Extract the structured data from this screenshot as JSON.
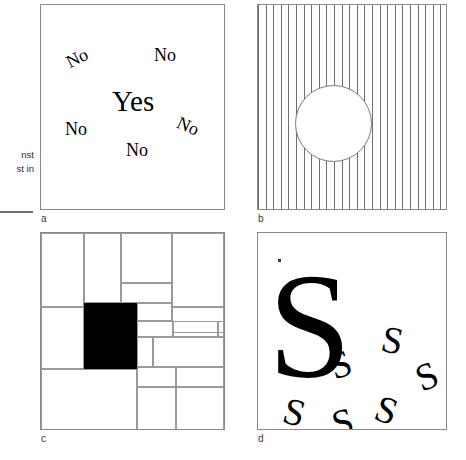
{
  "margin": {
    "note_lines": "nst\nst in"
  },
  "panels": [
    {
      "id": "a",
      "label": "a",
      "type": "word-popout",
      "target_word": "Yes",
      "distractor_word": "No",
      "items": [
        {
          "text": "Yes",
          "x": 71,
          "y": 82,
          "rotation": 0,
          "size": "large"
        },
        {
          "text": "No",
          "x": 25,
          "y": 44,
          "rotation": -27,
          "size": "small"
        },
        {
          "text": "No",
          "x": 113,
          "y": 41,
          "rotation": 0,
          "size": "small"
        },
        {
          "text": "No",
          "x": 24,
          "y": 115,
          "rotation": 0,
          "size": "small"
        },
        {
          "text": "No",
          "x": 136,
          "y": 112,
          "rotation": 24,
          "size": "small"
        },
        {
          "text": "No",
          "x": 85,
          "y": 136,
          "rotation": 0,
          "size": "small"
        }
      ]
    },
    {
      "id": "b",
      "label": "b",
      "type": "stripes-with-circle",
      "stripe_count": 25,
      "stripe_spacing_px": 7.6,
      "stripe_color": "#6f6f6f",
      "circle": {
        "cx": 75,
        "cy": 118,
        "r": 38,
        "fill": "#ffffff",
        "stroke": "#7a7a7a"
      }
    },
    {
      "id": "c",
      "label": "c",
      "type": "rectangle-partition",
      "fill_color": "#000000",
      "line_color": "#9a9a9a",
      "cells": [
        {
          "x": 0,
          "y": 0,
          "w": 43,
          "h": 74,
          "filled": false
        },
        {
          "x": 43,
          "y": 0,
          "w": 37,
          "h": 70,
          "filled": false
        },
        {
          "x": 80,
          "y": 0,
          "w": 51,
          "h": 50,
          "filled": false
        },
        {
          "x": 131,
          "y": 0,
          "w": 52,
          "h": 74,
          "filled": false
        },
        {
          "x": 80,
          "y": 50,
          "w": 51,
          "h": 20,
          "filled": false
        },
        {
          "x": 0,
          "y": 74,
          "w": 43,
          "h": 62,
          "filled": false
        },
        {
          "x": 43,
          "y": 70,
          "w": 53,
          "h": 66,
          "filled": true
        },
        {
          "x": 96,
          "y": 70,
          "w": 35,
          "h": 18,
          "filled": false
        },
        {
          "x": 131,
          "y": 74,
          "w": 52,
          "h": 26,
          "filled": false
        },
        {
          "x": 96,
          "y": 88,
          "w": 36,
          "h": 16,
          "filled": false
        },
        {
          "x": 132,
          "y": 88,
          "w": 45,
          "h": 16,
          "filled": false
        },
        {
          "x": 177,
          "y": 88,
          "w": 6,
          "h": 16,
          "filled": false
        },
        {
          "x": 96,
          "y": 104,
          "w": 16,
          "h": 30,
          "filled": false
        },
        {
          "x": 112,
          "y": 104,
          "w": 71,
          "h": 30,
          "filled": false
        },
        {
          "x": 96,
          "y": 134,
          "w": 39,
          "h": 20,
          "filled": false
        },
        {
          "x": 135,
          "y": 134,
          "w": 48,
          "h": 20,
          "filled": false
        },
        {
          "x": 0,
          "y": 136,
          "w": 96,
          "h": 62,
          "filled": false
        },
        {
          "x": 96,
          "y": 154,
          "w": 39,
          "h": 44,
          "filled": false
        },
        {
          "x": 135,
          "y": 154,
          "w": 48,
          "h": 44,
          "filled": false
        }
      ]
    },
    {
      "id": "d",
      "label": "d",
      "type": "letter-popout",
      "letter": "S",
      "items": [
        {
          "text": "S",
          "x": 10,
          "y": 18,
          "rotation": 0,
          "size": "large"
        },
        {
          "text": "S",
          "x": 72,
          "y": 112,
          "rotation": -18,
          "size": "small"
        },
        {
          "text": "S",
          "x": 124,
          "y": 88,
          "rotation": 12,
          "size": "small"
        },
        {
          "text": "S",
          "x": 158,
          "y": 124,
          "rotation": -22,
          "size": "small"
        },
        {
          "text": "S",
          "x": 26,
          "y": 160,
          "rotation": 16,
          "size": "small"
        },
        {
          "text": "S",
          "x": 74,
          "y": 170,
          "rotation": -14,
          "size": "small"
        },
        {
          "text": "S",
          "x": 118,
          "y": 158,
          "rotation": 20,
          "size": "small"
        }
      ]
    }
  ]
}
